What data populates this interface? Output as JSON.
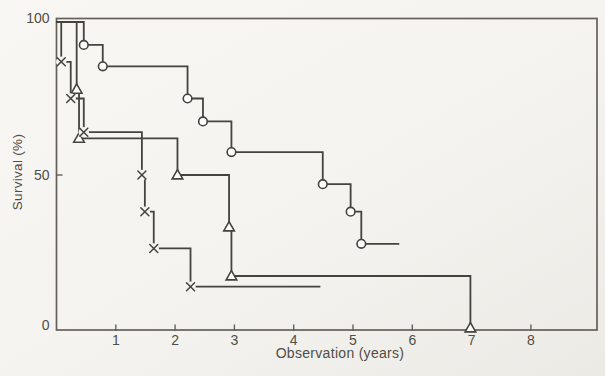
{
  "figure": {
    "background": "#f5f4f0",
    "frame_color": "#63615a",
    "curve_color": "#44433e",
    "text_color": "#4f4d47"
  },
  "chart_data": {
    "type": "line",
    "subtype": "kaplan-meier-step-curves",
    "title": "",
    "xlabel": "Observation (years)",
    "ylabel": "Survival (%)",
    "xlim": [
      0,
      9.1
    ],
    "ylim": [
      0,
      100
    ],
    "x_ticks": [
      1,
      2,
      3,
      4,
      5,
      6,
      7,
      8
    ],
    "y_ticks": [
      {
        "value": 0,
        "label": "0"
      },
      {
        "value": 50,
        "label": "50"
      },
      {
        "value": 100,
        "label": "100"
      }
    ],
    "grid": false,
    "legend": "none",
    "series": [
      {
        "name": "group-circle",
        "marker": "circle",
        "start": [
          0,
          100
        ],
        "steps": [
          [
            0.46,
            92.5
          ],
          [
            0.78,
            85.5
          ],
          [
            2.21,
            75
          ],
          [
            2.47,
            67.5
          ],
          [
            2.95,
            57.5
          ],
          [
            4.49,
            47
          ],
          [
            4.96,
            38
          ],
          [
            5.14,
            27.5
          ]
        ],
        "end_x": 5.78
      },
      {
        "name": "group-triangle",
        "marker": "triangle",
        "start": [
          0,
          100
        ],
        "steps": [
          [
            0.34,
            78
          ],
          [
            0.38,
            62
          ],
          [
            2.04,
            50
          ],
          [
            2.91,
            33
          ],
          [
            2.95,
            17
          ],
          [
            6.98,
            0
          ]
        ],
        "end_x": 6.98
      },
      {
        "name": "group-cross",
        "marker": "cross",
        "start": [
          0,
          100
        ],
        "steps": [
          [
            0.08,
            87
          ],
          [
            0.24,
            75
          ],
          [
            0.46,
            64
          ],
          [
            1.44,
            50
          ],
          [
            1.49,
            38
          ],
          [
            1.64,
            26
          ],
          [
            2.26,
            13.5
          ]
        ],
        "end_x": 4.45
      }
    ]
  }
}
